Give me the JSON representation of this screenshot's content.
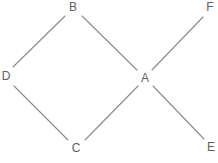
{
  "figure": {
    "type": "graph-diagram",
    "width": 218,
    "height": 163,
    "background_color": "#ffffff",
    "edge_color": "#8a8a8a",
    "label_color": "#5f5f5f"
  },
  "graph": {
    "directed": false,
    "nodes": [
      {
        "id": "A",
        "label": "A",
        "x": 145,
        "y": 78
      },
      {
        "id": "B",
        "label": "B",
        "x": 73,
        "y": 7
      },
      {
        "id": "C",
        "label": "C",
        "x": 76,
        "y": 148
      },
      {
        "id": "D",
        "label": "D",
        "x": 6,
        "y": 76
      },
      {
        "id": "E",
        "label": "E",
        "x": 211,
        "y": 147
      },
      {
        "id": "F",
        "label": "F",
        "x": 210,
        "y": 7
      }
    ],
    "edges": [
      {
        "id": "B-D",
        "from": "B",
        "to": "D",
        "x1": 65,
        "y1": 16,
        "x2": 13,
        "y2": 67
      },
      {
        "id": "B-A",
        "from": "B",
        "to": "A",
        "x1": 82,
        "y1": 16,
        "x2": 137,
        "y2": 70
      },
      {
        "id": "D-C",
        "from": "D",
        "to": "C",
        "x1": 14,
        "y1": 86,
        "x2": 68,
        "y2": 140
      },
      {
        "id": "C-A",
        "from": "C",
        "to": "A",
        "x1": 85,
        "y1": 140,
        "x2": 138,
        "y2": 86
      },
      {
        "id": "A-F",
        "from": "A",
        "to": "F",
        "x1": 152,
        "y1": 70,
        "x2": 203,
        "y2": 17
      },
      {
        "id": "A-E",
        "from": "A",
        "to": "E",
        "x1": 153,
        "y1": 86,
        "x2": 204,
        "y2": 139
      }
    ]
  }
}
